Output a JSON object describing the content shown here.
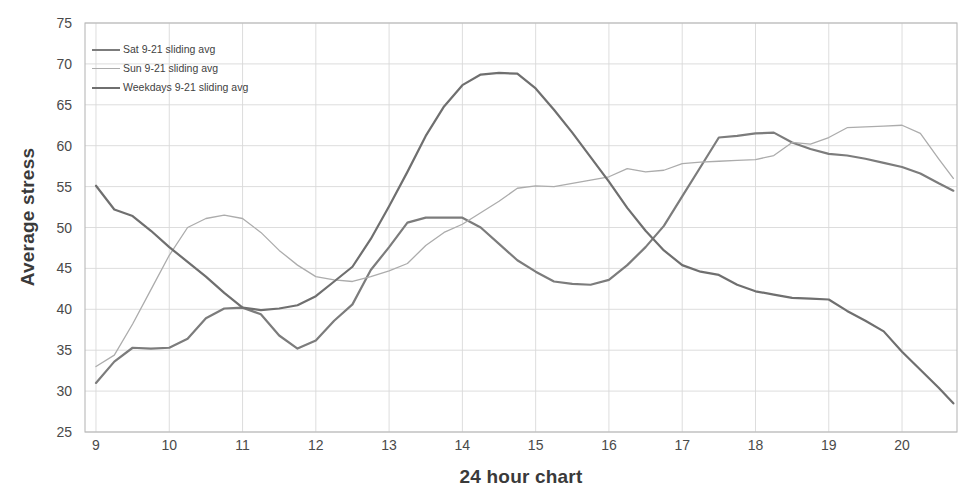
{
  "chart_data": {
    "type": "line",
    "title": "",
    "xlabel": "24 hour chart",
    "ylabel": "Average stress",
    "xlim": [
      8.85,
      20.75
    ],
    "ylim": [
      25,
      75
    ],
    "xticks": [
      9,
      10,
      11,
      12,
      13,
      14,
      15,
      16,
      17,
      18,
      19,
      20
    ],
    "yticks": [
      25,
      30,
      35,
      40,
      45,
      50,
      55,
      60,
      65,
      70,
      75
    ],
    "grid": true,
    "legend_position": "top-left",
    "series": [
      {
        "name": "Sat 9-21 sliding avg",
        "color": "#7c7c7c",
        "x": [
          9.0,
          9.25,
          9.5,
          9.75,
          10.0,
          10.25,
          10.5,
          10.75,
          11.0,
          11.25,
          11.5,
          11.75,
          12.0,
          12.25,
          12.5,
          12.75,
          13.0,
          13.25,
          13.5,
          13.75,
          14.0,
          14.25,
          14.5,
          14.75,
          15.0,
          15.25,
          15.5,
          15.75,
          16.0,
          16.25,
          16.5,
          16.75,
          17.0,
          17.25,
          17.5,
          17.75,
          18.0,
          18.25,
          18.5,
          18.75,
          19.0,
          19.25,
          19.5,
          19.75,
          20.0,
          20.25,
          20.5,
          20.7
        ],
        "values": [
          31.0,
          33.6,
          35.3,
          35.2,
          35.3,
          36.4,
          38.9,
          40.1,
          40.2,
          39.4,
          36.8,
          35.2,
          36.2,
          38.6,
          40.6,
          44.8,
          47.6,
          50.6,
          51.2,
          51.2,
          51.2,
          50.0,
          48.0,
          46.0,
          44.6,
          43.4,
          43.1,
          43.0,
          43.6,
          45.4,
          47.6,
          50.2,
          53.8,
          57.4,
          61.0,
          61.2,
          61.5,
          61.6,
          60.4,
          59.6,
          59.0,
          58.8,
          58.4,
          57.9,
          57.4,
          56.6,
          55.4,
          54.5
        ]
      },
      {
        "name": "Sun 9-21 sliding avg",
        "color": "#acacac",
        "x": [
          9.0,
          9.25,
          9.5,
          9.75,
          10.0,
          10.25,
          10.5,
          10.75,
          11.0,
          11.25,
          11.5,
          11.75,
          12.0,
          12.25,
          12.5,
          12.75,
          13.0,
          13.25,
          13.5,
          13.75,
          14.0,
          14.25,
          14.5,
          14.75,
          15.0,
          15.25,
          15.5,
          15.75,
          16.0,
          16.25,
          16.5,
          16.75,
          17.0,
          17.25,
          17.5,
          17.75,
          18.0,
          18.25,
          18.5,
          18.75,
          19.0,
          19.25,
          19.5,
          19.75,
          20.0,
          20.25,
          20.5,
          20.7
        ],
        "values": [
          33.0,
          34.4,
          38.2,
          42.4,
          46.6,
          50.0,
          51.1,
          51.5,
          51.1,
          49.4,
          47.2,
          45.4,
          44.0,
          43.6,
          43.4,
          44.0,
          44.7,
          45.6,
          47.8,
          49.4,
          50.4,
          51.8,
          53.2,
          54.8,
          55.1,
          55.0,
          55.4,
          55.8,
          56.2,
          57.2,
          56.8,
          57.0,
          57.8,
          58.0,
          58.1,
          58.2,
          58.3,
          58.8,
          60.4,
          60.2,
          61.0,
          62.2,
          62.3,
          62.4,
          62.5,
          61.5,
          58.4,
          56.0
        ]
      },
      {
        "name": "Weekdays 9-21 sliding avg",
        "color": "#6f6f6f",
        "x": [
          9.0,
          9.25,
          9.5,
          9.75,
          10.0,
          10.25,
          10.5,
          10.75,
          11.0,
          11.25,
          11.5,
          11.75,
          12.0,
          12.25,
          12.5,
          12.75,
          13.0,
          13.25,
          13.5,
          13.75,
          14.0,
          14.25,
          14.5,
          14.75,
          15.0,
          15.25,
          15.5,
          15.75,
          16.0,
          16.25,
          16.5,
          16.75,
          17.0,
          17.25,
          17.5,
          17.75,
          18.0,
          18.25,
          18.5,
          18.75,
          19.0,
          19.25,
          19.5,
          19.75,
          20.0,
          20.25,
          20.5,
          20.7
        ],
        "values": [
          55.1,
          52.2,
          51.4,
          49.6,
          47.6,
          45.8,
          44.0,
          42.0,
          40.2,
          39.9,
          40.1,
          40.5,
          41.6,
          43.4,
          45.2,
          48.6,
          52.6,
          56.8,
          61.2,
          64.8,
          67.4,
          68.7,
          68.9,
          68.8,
          67.0,
          64.4,
          61.6,
          58.6,
          55.6,
          52.4,
          49.6,
          47.2,
          45.4,
          44.6,
          44.2,
          43.0,
          42.2,
          41.8,
          41.4,
          41.3,
          41.2,
          39.8,
          38.6,
          37.3,
          34.8,
          32.6,
          30.4,
          28.5
        ]
      }
    ]
  },
  "legend": {
    "items": [
      {
        "label": "Sat 9-21 sliding avg",
        "color": "#7c7c7c",
        "width": 2.2
      },
      {
        "label": "Sun 9-21 sliding avg",
        "color": "#acacac",
        "width": 1.3
      },
      {
        "label": "Weekdays 9-21 sliding avg",
        "color": "#6f6f6f",
        "width": 2.2
      }
    ]
  },
  "axes": {
    "y_title": "Average stress",
    "x_title": "24 hour chart",
    "y_tick_labels": [
      "75",
      "70",
      "65",
      "60",
      "55",
      "50",
      "45",
      "40",
      "35",
      "30",
      "25"
    ],
    "x_tick_labels": [
      "9",
      "10",
      "11",
      "12",
      "13",
      "14",
      "15",
      "16",
      "17",
      "18",
      "19",
      "20"
    ]
  },
  "style": {
    "grid_color": "#d9d9d9",
    "frame_color": "#b8b8b8",
    "text_color": "#4a4a4a",
    "background": "#ffffff"
  }
}
